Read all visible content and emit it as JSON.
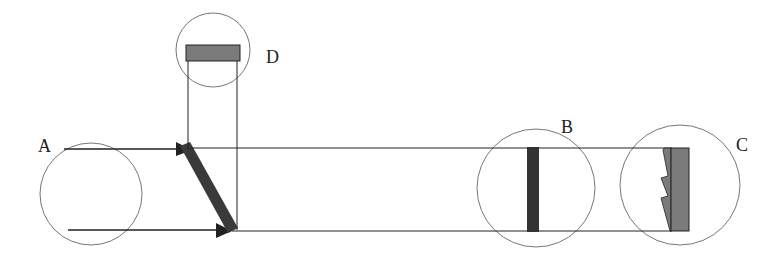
{
  "labels": {
    "A": "A",
    "B": "B",
    "C": "C",
    "D": "D"
  },
  "colors": {
    "line": "#222222",
    "circle": "#777777",
    "fill_dark": "#3a3a3a",
    "fill_mid": "#7a7a7a",
    "background": "#ffffff"
  }
}
